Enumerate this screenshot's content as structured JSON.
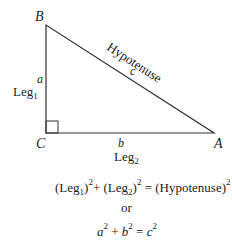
{
  "diagram": {
    "vertices": {
      "B": {
        "label": "B",
        "x": 46,
        "y": 25
      },
      "C": {
        "label": "C",
        "x": 46,
        "y": 133
      },
      "A": {
        "label": "A",
        "x": 214,
        "y": 133
      }
    },
    "sides": {
      "a": {
        "var": "a",
        "name": "Leg",
        "sub": "1"
      },
      "b": {
        "var": "b",
        "name": "Leg",
        "sub": "2"
      },
      "c": {
        "var": "c",
        "name": "Hypotenuse"
      }
    },
    "right_angle_at": "C",
    "stroke_color": "#333333"
  },
  "equations": {
    "line1": {
      "leg1_open": "(Leg",
      "leg1_sub": "1",
      "leg1_close": ")",
      "exp": "2",
      "plus": "+ ",
      "leg2_open": "(Leg",
      "leg2_sub": "2",
      "leg2_close": ")",
      "equals": " = ",
      "hyp": "(Hypotenuse)"
    },
    "or": "or",
    "line3": {
      "a": "a",
      "b": "b",
      "c": "c",
      "exp": "2",
      "plus": " +  ",
      "equals": " = "
    }
  }
}
